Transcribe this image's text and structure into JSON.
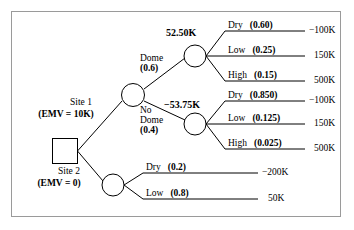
{
  "diagram": {
    "type": "decision-tree",
    "colors": {
      "line": "#000000",
      "border": "#9a9a9a",
      "background": "#ffffff",
      "text": "#000000"
    },
    "decision_node": {
      "name": "root-decision",
      "shape": "square"
    },
    "alternatives": [
      {
        "id": "site1",
        "label_top": "Site 1",
        "label_emv": "(EMV = 10K)"
      },
      {
        "id": "site2",
        "label_top": "Site 2",
        "label_emv": "(EMV = 0)"
      }
    ],
    "site1_node": {
      "name": "site1-chance-node",
      "shape": "circle",
      "branches": [
        {
          "name": "Dome",
          "prob": "(0.6)"
        },
        {
          "name": "No\nDome",
          "prob": "(0.4)"
        }
      ]
    },
    "dome_branch_label_line1": "Dome",
    "dome_branch_label_line2": "(0.6)",
    "nodome_branch_label_line1": "No",
    "nodome_branch_label_line2": "Dome",
    "nodome_branch_label_line3": "(0.4)",
    "dome_value": "52.50K",
    "nodome_value": "−53.75K",
    "dome_outcomes": [
      {
        "name": "Dry",
        "prob": "(0.60)",
        "payoff": "−100K"
      },
      {
        "name": "Low",
        "prob": "(0.25)",
        "payoff": "150K"
      },
      {
        "name": "High",
        "prob": "(0.15)",
        "payoff": "500K"
      }
    ],
    "nodome_outcomes": [
      {
        "name": "Dry",
        "prob": "(0.850)",
        "payoff": "−100K"
      },
      {
        "name": "Low",
        "prob": "(0.125)",
        "payoff": "150K"
      },
      {
        "name": "High",
        "prob": "(0.025)",
        "payoff": "500K"
      }
    ],
    "site2_outcomes": [
      {
        "name": "Dry",
        "prob": "(0.2)",
        "payoff": "−200K"
      },
      {
        "name": "Low",
        "prob": "(0.8)",
        "payoff": "50K"
      }
    ]
  }
}
